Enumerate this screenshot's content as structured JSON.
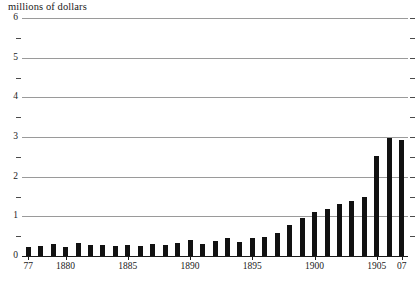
{
  "chart_data": {
    "type": "bar",
    "title": "",
    "ylabel": "millions of dollars",
    "xlabel": "",
    "ylim": [
      0,
      6
    ],
    "y_major_ticks": [
      0,
      1,
      2,
      3,
      4,
      5,
      6
    ],
    "y_major_tick_labels": [
      "0",
      "1",
      "2",
      "3",
      "4",
      "5",
      "6"
    ],
    "y_minor_ticks": [
      0.5,
      1.5,
      2.5,
      3.5,
      4.5,
      5.5
    ],
    "grid": "horizontal-major",
    "legend": "none",
    "bar_color": "#111111",
    "grid_color": "#9a9a9a",
    "axis_color": "#1a1a1a",
    "x_tick_label_years": [
      1877,
      1880,
      1885,
      1890,
      1895,
      1900,
      1905,
      1907
    ],
    "x_tick_labels": [
      "77",
      "1880",
      "1885",
      "1890",
      "1895",
      "1900",
      "1905",
      "07"
    ],
    "categories": [
      "1877",
      "1878",
      "1879",
      "1880",
      "1881",
      "1882",
      "1883",
      "1884",
      "1885",
      "1886",
      "1887",
      "1888",
      "1889",
      "1890",
      "1891",
      "1892",
      "1893",
      "1894",
      "1895",
      "1896",
      "1897",
      "1898",
      "1899",
      "1900",
      "1901",
      "1902",
      "1903",
      "1904",
      "1905",
      "1906",
      "1907"
    ],
    "values": [
      0.22,
      0.24,
      0.3,
      0.22,
      0.33,
      0.28,
      0.27,
      0.26,
      0.28,
      0.26,
      0.3,
      0.29,
      0.33,
      0.41,
      0.31,
      0.39,
      0.45,
      0.36,
      0.45,
      0.47,
      0.58,
      0.78,
      0.95,
      1.1,
      1.18,
      1.32,
      1.38,
      1.5,
      2.52,
      2.98,
      2.92
    ]
  }
}
